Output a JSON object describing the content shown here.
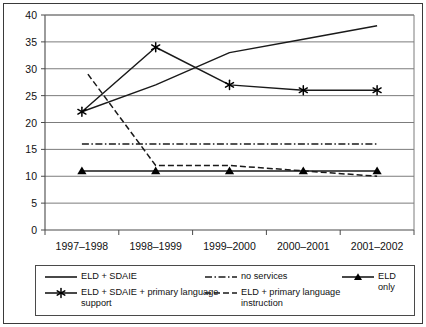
{
  "chart_data": {
    "type": "line",
    "title": "",
    "xlabel": "",
    "ylabel": "",
    "categories": [
      "1997–1998",
      "1998–1999",
      "1999–2000",
      "2000–2001",
      "2001–2002"
    ],
    "ylim": [
      0,
      40
    ],
    "ytick_step": 5,
    "yticks": [
      "0",
      "5",
      "10",
      "15",
      "20",
      "25",
      "30",
      "35",
      "40"
    ],
    "grid": "horizontal",
    "legend_position": "bottom",
    "series": [
      {
        "name": "ELD + SDAIE",
        "style": "solid",
        "marker": "none",
        "values": [
          22,
          27,
          33,
          35.5,
          38
        ]
      },
      {
        "name": "ELD + SDAIE + primary language support",
        "style": "solid",
        "marker": "star",
        "values": [
          22,
          34,
          27,
          26,
          26
        ]
      },
      {
        "name": "no services",
        "style": "dash-dot",
        "marker": "none",
        "values": [
          16,
          16,
          16,
          16,
          16
        ]
      },
      {
        "name": "ELD + primary language instruction",
        "style": "dashed",
        "marker": "none",
        "values": [
          29,
          12,
          12,
          11,
          10
        ]
      },
      {
        "name": "ELD only",
        "style": "solid",
        "marker": "triangle",
        "values": [
          11,
          11,
          11,
          11,
          11
        ]
      }
    ]
  },
  "legend": {
    "items": [
      {
        "label": "ELD + SDAIE",
        "style": "solid",
        "marker": "none"
      },
      {
        "label": "ELD + SDAIE + primary language support",
        "style": "solid",
        "marker": "star"
      },
      {
        "label": "no services",
        "style": "dash-dot",
        "marker": "none"
      },
      {
        "label": "ELD + primary language instruction",
        "style": "dashed",
        "marker": "none"
      },
      {
        "label": "ELD only",
        "style": "solid",
        "marker": "triangle"
      }
    ]
  },
  "colors": {
    "line": "#1a1a1a",
    "grid": "#7c7c7c",
    "axis": "#4a4a4a",
    "frame": "#3a3a3a",
    "text": "#111111",
    "background": "#ffffff"
  }
}
